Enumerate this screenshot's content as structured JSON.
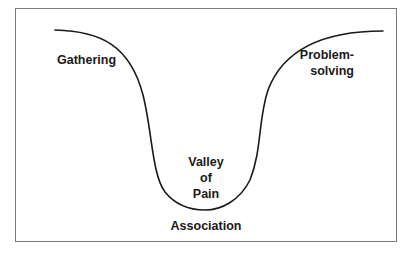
{
  "diagram": {
    "type": "u-curve",
    "labels": {
      "left_top": "Gathering",
      "right_top_line1": "Problem-",
      "right_top_line2": "solving",
      "valley_line1": "Valley",
      "valley_line2": "of",
      "valley_line3": "Pain",
      "bottom": "Association"
    },
    "colors": {
      "curve": "#1a1a1a",
      "frame": "#7a7a7a",
      "background": "#ffffff",
      "text": "#1a1a1a"
    }
  }
}
